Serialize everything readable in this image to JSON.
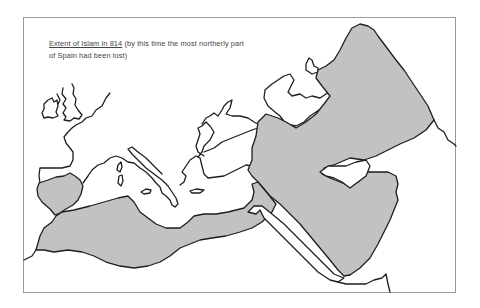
{
  "map": {
    "caption": {
      "title": "Extent of Islam in 814",
      "note": " (by this time the most northerly part of Spain had been lost)"
    },
    "legend": {
      "shaded_region": "Extent of Islam in 814"
    },
    "colors": {
      "islam_fill": "#c2c2c2",
      "coastline": "#1e1e1e",
      "background": "#ffffff",
      "frame": "#9a9a9a"
    }
  }
}
